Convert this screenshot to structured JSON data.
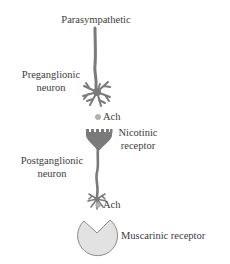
{
  "title": "Parasympathetic",
  "labels": {
    "preganglionic_line1": "Preganglionic",
    "preganglionic_line2": "neuron",
    "ach_1": "Ach",
    "nicotinic_line1": "Nicotinic",
    "nicotinic_line2": "receptor",
    "postganglionic_line1": "Postganglionic",
    "postganglionic_line2": "neuron",
    "ach_2": "Ach",
    "muscarinic": "Muscarinic receptor"
  },
  "colors": {
    "neuron": "#7a7a7a",
    "receptor_fill": "#e2e2e2",
    "receptor_stroke": "#8a8a8a",
    "ach_dot": "#b5b5b5",
    "text": "#3c3c3c"
  }
}
